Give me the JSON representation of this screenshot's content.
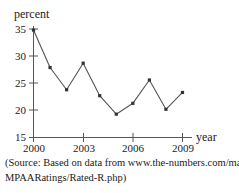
{
  "chart_data": {
    "type": "line",
    "title": "",
    "subtitle": "",
    "xlabel": "year",
    "ylabel": "percent",
    "x": [
      2000,
      2001,
      2002,
      2003,
      2004,
      2005,
      2006,
      2007,
      2008,
      2009
    ],
    "values": [
      34.8,
      27.9,
      23.8,
      28.7,
      22.7,
      19.3,
      21.3,
      25.6,
      20.2,
      23.3
    ],
    "series": [
      {
        "name": "percent of films rated R",
        "values": [
          34.8,
          27.9,
          23.8,
          28.7,
          22.7,
          19.3,
          21.3,
          25.6,
          20.2,
          23.3
        ]
      }
    ],
    "xlim": [
      2000,
      2009
    ],
    "ylim": [
      15,
      35
    ],
    "xticks": [
      2000,
      2003,
      2006,
      2009
    ],
    "xtick_labels": [
      "2000",
      "2003",
      "2006",
      "2009"
    ],
    "yticks": [
      15,
      20,
      25,
      30,
      35
    ],
    "ytick_labels": [
      "15",
      "20",
      "25",
      "30",
      "35"
    ],
    "grid": false,
    "legend": false,
    "legend_position": "none",
    "marker": "square",
    "line_color": "#555555",
    "marker_color": "#333333",
    "axis_color": "#555555"
  },
  "axes": {
    "y_title": "percent",
    "x_title": "year"
  },
  "source": {
    "line1": "(Source: Based on data from www.the-numbers.com/market/",
    "line2": "MPAARatings/Rated-R.php)"
  }
}
